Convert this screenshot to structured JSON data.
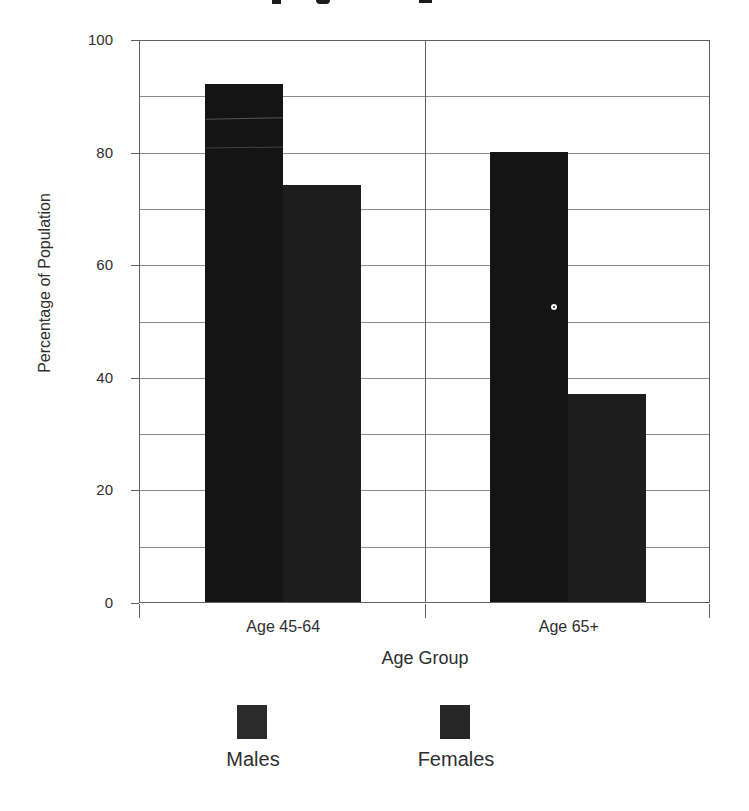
{
  "figure": {
    "background": "#ffffff",
    "cropped_title_visible": true
  },
  "chart_data": {
    "type": "bar",
    "categories": [
      "Age 45-64",
      "Age 65+"
    ],
    "series": [
      {
        "name": "Males",
        "values": [
          92,
          80
        ],
        "color": "#141414"
      },
      {
        "name": "Females",
        "values": [
          74,
          37
        ],
        "color": "#1d1d1d"
      }
    ],
    "title": "",
    "xlabel": "Age Group",
    "ylabel": "Percentage of Population",
    "ylim": [
      0,
      100
    ],
    "yticks": [
      0,
      20,
      40,
      60,
      80,
      100
    ],
    "ytick_interval": 20,
    "ygrid_interval": 10,
    "grid": true,
    "legend_position": "bottom"
  },
  "legend": {
    "items": [
      {
        "label": "Males",
        "color": "#2b2b2b"
      },
      {
        "label": "Females",
        "color": "#262626"
      }
    ]
  },
  "colors": {
    "grid": "#8a8a8a",
    "axis": "#5f5f5f",
    "text": "#2e2e2e"
  }
}
